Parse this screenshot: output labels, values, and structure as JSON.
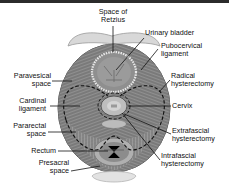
{
  "figure": {
    "colors": {
      "top_bar": "#2b2b2b",
      "tissue_dark": "#6e6e6e",
      "tissue_mid": "#8a8a8a",
      "tissue_light": "#b8b8b8",
      "bone_light": "#dcdcdc",
      "line": "#111111"
    },
    "labels": {
      "space_of_retzius": [
        "Space of",
        "Retzius"
      ],
      "urinary_bladder": "Urinary bladder",
      "pubocervical_ligament": [
        "Pubocervical",
        "ligament"
      ],
      "paravesical_space": [
        "Paravesical",
        "space"
      ],
      "radical_hysterectomy": [
        "Radical",
        "hysterectomy"
      ],
      "cardinal_ligament": [
        "Cardinal",
        "ligament"
      ],
      "cervix": "Cervix",
      "pararectal_space": [
        "Pararectal",
        "space"
      ],
      "extrafascial_hysterectomy": [
        "Extrafascial",
        "hysterectomy"
      ],
      "rectum": "Rectum",
      "intrafascial_hysterectomy": [
        "Intrafascial",
        "hysterectomy"
      ],
      "presacral_space": [
        "Presacral",
        "space"
      ]
    }
  }
}
